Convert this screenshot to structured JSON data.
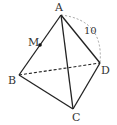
{
  "diagram": {
    "type": "tetrahedron",
    "vertices": {
      "A": {
        "label": "A",
        "x": 61,
        "y": 15
      },
      "B": {
        "label": "B",
        "x": 19,
        "y": 75
      },
      "C": {
        "label": "C",
        "x": 73,
        "y": 109
      },
      "D": {
        "label": "D",
        "x": 100,
        "y": 63
      }
    },
    "point_M": {
      "label": "M",
      "x": 40,
      "y": 45,
      "on_edge": "AB"
    },
    "edges_solid": [
      "AB",
      "AC",
      "AD",
      "BC",
      "CD"
    ],
    "edges_dashed": [
      "BD"
    ],
    "arc": {
      "from": "A",
      "to": "D",
      "label": "10",
      "style": "dashed"
    },
    "colors": {
      "line": "#222222",
      "dashed_arc": "#999999",
      "text": "#333333"
    }
  }
}
